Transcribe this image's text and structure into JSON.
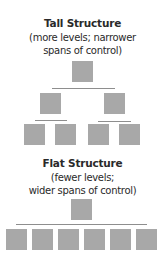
{
  "tall": {
    "title": "Tall Structure",
    "subtitle_1": "(more levels; narrower",
    "subtitle_2": "spans of control)"
  },
  "flat": {
    "title": "Flat Structure",
    "subtitle_1": "(fewer levels;",
    "subtitle_2": "wider spans of control)"
  },
  "colors": {
    "box": "#a8a8a8",
    "line": "#8e8e8e",
    "text": "#2a2a2a"
  }
}
